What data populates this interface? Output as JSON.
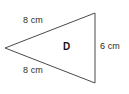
{
  "figure": {
    "type": "geometry-diagram",
    "background_color": "#ffffff",
    "stroke_color": "#4a4a4a",
    "shape": {
      "name": "triangle",
      "interior_label": "D",
      "orientation": "apex-left",
      "vertices": [
        {
          "id": "apex-left",
          "x": 5,
          "y": 48
        },
        {
          "id": "top-right",
          "x": 95,
          "y": 13
        },
        {
          "id": "bottom-right",
          "x": 95,
          "y": 83
        }
      ],
      "sides": [
        {
          "id": "top-left-side",
          "label": "8 cm",
          "length": 8,
          "unit": "cm"
        },
        {
          "id": "bottom-left-side",
          "label": "8 cm",
          "length": 8,
          "unit": "cm"
        },
        {
          "id": "right-side",
          "label": "6 cm",
          "length": 6,
          "unit": "cm"
        }
      ]
    },
    "labels": {
      "top_side": "8 cm",
      "bottom_side": "8 cm",
      "right_side": "6 cm",
      "shape_name": "D"
    }
  }
}
